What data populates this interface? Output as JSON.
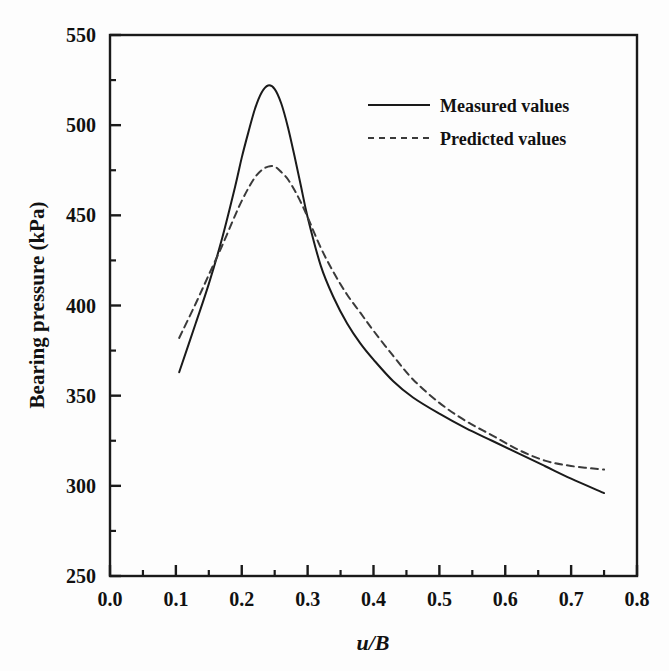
{
  "chart_data": {
    "type": "line",
    "title": "",
    "xlabel": "u/B",
    "ylabel": "Bearing pressure (kPa)",
    "xlim": [
      0.0,
      0.8
    ],
    "ylim": [
      250,
      550
    ],
    "xticks": [
      "0.0",
      "0.1",
      "0.2",
      "0.3",
      "0.4",
      "0.5",
      "0.6",
      "0.7",
      "0.8"
    ],
    "xtick_values": [
      0.0,
      0.1,
      0.2,
      0.3,
      0.4,
      0.5,
      0.6,
      0.7,
      0.8
    ],
    "yticks": [
      "250",
      "300",
      "350",
      "400",
      "450",
      "500",
      "550"
    ],
    "ytick_values": [
      250,
      300,
      350,
      400,
      450,
      500,
      550
    ],
    "minor_xtick_values": [
      0.05,
      0.15,
      0.25,
      0.35,
      0.45,
      0.55,
      0.65,
      0.75
    ],
    "minor_ytick_values": [
      275,
      325,
      375,
      425,
      475,
      525
    ],
    "grid": false,
    "legend_position": "upper-right",
    "series": [
      {
        "name": "Measured values",
        "style": "solid",
        "color": "#1a1a1a",
        "x": [
          0.105,
          0.13,
          0.15,
          0.17,
          0.19,
          0.2,
          0.21,
          0.22,
          0.23,
          0.24,
          0.25,
          0.26,
          0.27,
          0.28,
          0.29,
          0.3,
          0.32,
          0.34,
          0.36,
          0.38,
          0.4,
          0.43,
          0.46,
          0.5,
          0.54,
          0.58,
          0.62,
          0.66,
          0.7,
          0.75
        ],
        "y": [
          363,
          390,
          412,
          437,
          466,
          482,
          496,
          509,
          518,
          522,
          520,
          512,
          499,
          483,
          466,
          449,
          422,
          404,
          390,
          379,
          370,
          358,
          349,
          340,
          332,
          325,
          318,
          311,
          304,
          296
        ]
      },
      {
        "name": "Predicted values",
        "style": "dashed",
        "color": "#3a3a3a",
        "x": [
          0.105,
          0.13,
          0.15,
          0.17,
          0.19,
          0.2,
          0.21,
          0.22,
          0.23,
          0.24,
          0.25,
          0.26,
          0.27,
          0.28,
          0.29,
          0.3,
          0.32,
          0.34,
          0.36,
          0.38,
          0.4,
          0.43,
          0.46,
          0.5,
          0.54,
          0.58,
          0.62,
          0.66,
          0.7,
          0.75
        ],
        "y": [
          382,
          401,
          417,
          433,
          450,
          458,
          465,
          471,
          475,
          477,
          477,
          474,
          470,
          464,
          457,
          449,
          432,
          418,
          406,
          396,
          386,
          372,
          359,
          346,
          336,
          328,
          320,
          314,
          311,
          309
        ]
      }
    ],
    "annotations": {
      "measured_peak": {
        "x": 0.24,
        "y": 522
      },
      "predicted_peak": {
        "x": 0.245,
        "y": 477
      }
    }
  },
  "legend": {
    "items": [
      {
        "label": "Measured values",
        "style": "solid"
      },
      {
        "label": "Predicted values",
        "style": "dashed"
      }
    ]
  },
  "axis": {
    "x_title": "u/B",
    "y_title": "Bearing pressure (kPa)"
  }
}
